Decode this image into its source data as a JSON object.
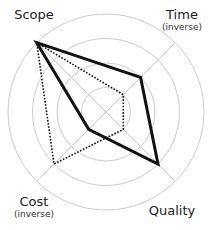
{
  "chart_data": {
    "type": "radar",
    "title": "",
    "axes": [
      {
        "label": "Scope",
        "sublabel": "",
        "angle_deg": 135
      },
      {
        "label": "Time",
        "sublabel": "(inverse)",
        "angle_deg": 45
      },
      {
        "label": "Quality",
        "sublabel": "",
        "angle_deg": -45
      },
      {
        "label": "Cost",
        "sublabel": "(inverse)",
        "angle_deg": -135
      }
    ],
    "rings": [
      1,
      2,
      3,
      4
    ],
    "range": [
      0,
      4
    ],
    "grid": true,
    "legend": false,
    "series": [
      {
        "name": "solid",
        "style": "solid",
        "values": [
          4,
          2,
          3,
          1
        ]
      },
      {
        "name": "dotted",
        "style": "dotted",
        "values": [
          4,
          1,
          1,
          3
        ]
      }
    ]
  },
  "colors": {
    "grid": "#cccccc",
    "series": "#111111",
    "text": "#222222"
  }
}
